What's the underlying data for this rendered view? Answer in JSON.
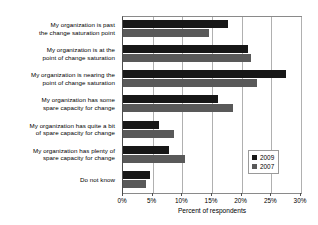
{
  "chart_data": {
    "type": "bar",
    "orientation": "horizontal",
    "title": "",
    "xlabel": "Percent of respondents",
    "ylabel": "",
    "xlim": [
      0,
      30
    ],
    "xticks": [
      0,
      5,
      10,
      15,
      20,
      25,
      30
    ],
    "xtick_labels": [
      "0%",
      "5%",
      "10%",
      "15%",
      "20%",
      "25%",
      "30%"
    ],
    "grid": true,
    "legend_position": "lower right",
    "categories": [
      "My organization is past the change saturation point",
      "My organization is at the point of change saturation",
      "My organization is nearing the point of change saturation",
      "My organization has some spare capacity for change",
      "My organization has quite a bit of spare capacity for change",
      "My organization has plenty of spare capacity for change",
      "Do not know"
    ],
    "category_lines": [
      [
        "My organization is past",
        "the change saturation point"
      ],
      [
        "My organization is at the",
        "point of change saturation"
      ],
      [
        "My organization is nearing the",
        "point of change saturation"
      ],
      [
        "My organization has some",
        "spare capacity for change"
      ],
      [
        "My organization has quite a bit",
        "of spare capacity for change"
      ],
      [
        "My organization has plenty of",
        "spare capacity for change"
      ],
      [
        "Do not know"
      ]
    ],
    "series": [
      {
        "name": "2009",
        "color": "#171717",
        "values": [
          17.7,
          21.0,
          27.5,
          16.0,
          6.0,
          7.8,
          4.5
        ]
      },
      {
        "name": "2007",
        "color": "#595959",
        "values": [
          14.5,
          21.5,
          22.5,
          18.5,
          8.6,
          10.5,
          3.8
        ]
      }
    ]
  },
  "legend": {
    "entries": [
      {
        "label": "2009"
      },
      {
        "label": "2007"
      }
    ]
  },
  "axis": {
    "x_title": "Percent of respondents"
  },
  "colors": {
    "series_2009": "#171717",
    "series_2007": "#595959",
    "grid": "#b0b0b0",
    "frame": "#8a8a8a",
    "background": "#ffffff"
  }
}
